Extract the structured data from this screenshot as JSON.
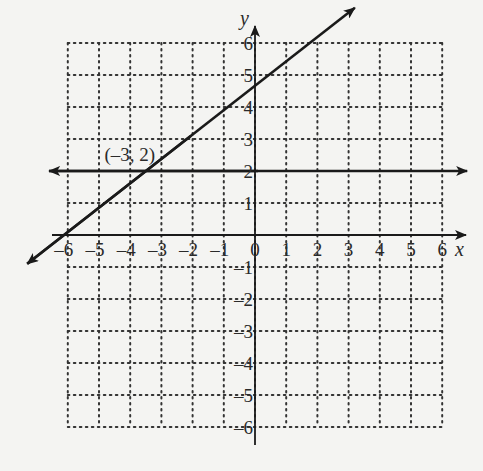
{
  "chart_data": {
    "type": "line",
    "title": "",
    "xlabel": "x",
    "ylabel": "y",
    "xlim": [
      -6,
      6
    ],
    "ylim": [
      -6,
      6
    ],
    "grid": true,
    "grid_style": "dotted",
    "x_ticks": [
      -6,
      -5,
      -4,
      -3,
      -2,
      -1,
      0,
      1,
      2,
      3,
      4,
      5,
      6
    ],
    "y_ticks": [
      -6,
      -5,
      -4,
      -3,
      -2,
      -1,
      1,
      2,
      3,
      4,
      5,
      6
    ],
    "x_tick_labels": [
      "–6",
      "–5",
      "–4",
      "–3",
      "–2",
      "–1",
      "0",
      "1",
      "2",
      "3",
      "4",
      "5",
      "6"
    ],
    "y_tick_labels": [
      "–6",
      "–5",
      "–4",
      "–3",
      "–2",
      "–1",
      "1",
      "2",
      "3",
      "4",
      "5",
      "6"
    ],
    "series": [
      {
        "name": "horizontal line y = 2",
        "kind": "line",
        "points": [
          [
            -6.6,
            2
          ],
          [
            6.8,
            2
          ]
        ],
        "arrows": "both"
      },
      {
        "name": "oblique line through (-3, 2)",
        "kind": "line",
        "points": [
          [
            -7.3,
            -0.9
          ],
          [
            3.2,
            7.1
          ]
        ],
        "arrows": "both",
        "slope_approx": 0.76,
        "y_intercept_approx": 4.3
      }
    ],
    "annotations": [
      {
        "text": "(–3, 2)",
        "x": -3,
        "y": 2
      }
    ]
  },
  "labels": {
    "x_axis": "x",
    "y_axis": "y",
    "point": "(–3, 2)"
  }
}
